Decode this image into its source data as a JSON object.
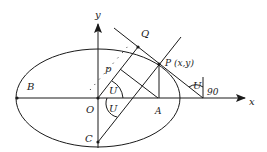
{
  "diagram": {
    "type": "geometry-ellipse",
    "axes": {
      "x_label": "x",
      "y_label": "y"
    },
    "points": {
      "O": {
        "label": "O"
      },
      "A": {
        "label": "A"
      },
      "B": {
        "label": "B"
      },
      "C": {
        "label": "C"
      },
      "P": {
        "label": "P (x,y)"
      },
      "Q": {
        "label": "Q"
      },
      "p": {
        "label": "p"
      }
    },
    "angles": {
      "u1": "U",
      "u2": "U",
      "u3": "U",
      "right": "90"
    },
    "colors": {
      "stroke": "#1a1a1a",
      "background": "#ffffff"
    }
  }
}
